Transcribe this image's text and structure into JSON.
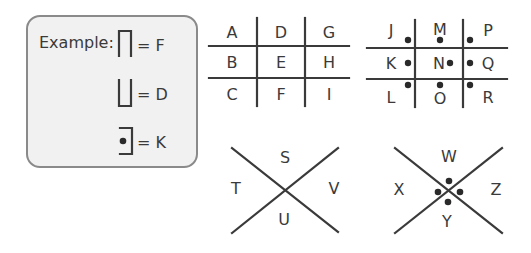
{
  "example": {
    "label": "Example:",
    "items": [
      {
        "equals": "= F",
        "letter": "F",
        "glyph": "top-left-right-bracket"
      },
      {
        "equals": "= D",
        "letter": "D",
        "glyph": "bottom-left-right-bracket"
      },
      {
        "equals": "= K",
        "letter": "K",
        "glyph": "top-right-bottom-bracket-dot"
      }
    ]
  },
  "grid_plain": {
    "cells": [
      "A",
      "D",
      "G",
      "B",
      "E",
      "H",
      "C",
      "F",
      "I"
    ]
  },
  "grid_dotted": {
    "cells": [
      "J",
      "M",
      "P",
      "K",
      "N",
      "Q",
      "L",
      "O",
      "R"
    ]
  },
  "x_plain": {
    "top": "S",
    "left": "T",
    "right": "V",
    "bottom": "U"
  },
  "x_dotted": {
    "top": "W",
    "left": "X",
    "right": "Z",
    "bottom": "Y"
  },
  "colors": {
    "line": "#3a3a3a",
    "box_fill": "#f1f1f1",
    "box_border": "#8a8a8a"
  }
}
